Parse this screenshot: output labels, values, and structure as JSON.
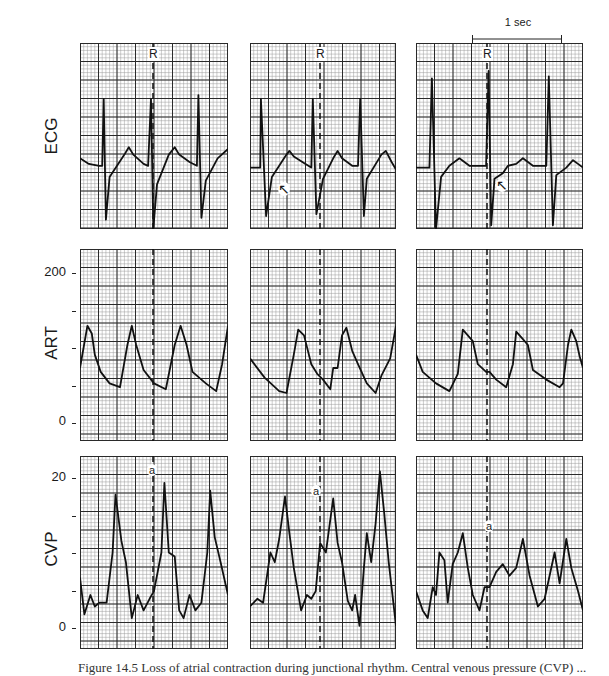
{
  "rows": [
    {
      "id": "ecg",
      "label": "ECG"
    },
    {
      "id": "art",
      "label": "ART",
      "ticks": [
        {
          "label": "200",
          "value": 200
        },
        {
          "label": "",
          "value": 150
        },
        {
          "label": "",
          "value": 100
        },
        {
          "label": "",
          "value": 50
        },
        {
          "label": "0",
          "value": 0
        }
      ]
    },
    {
      "id": "cvp",
      "label": "CVP",
      "ticks": [
        {
          "label": "20",
          "value": 20
        },
        {
          "label": "",
          "value": 15
        },
        {
          "label": "",
          "value": 10
        },
        {
          "label": "",
          "value": 5
        },
        {
          "label": "0",
          "value": 0
        }
      ]
    }
  ],
  "annotations": {
    "r_label": "R",
    "a_label": "a",
    "scale_bar": "1 sec",
    "caption": "Figure 14.5 Loss of atrial contraction during junctional rhythm. Central venous pressure (CVP) ..."
  },
  "colors": {
    "grid_minor": "#9a9a9a",
    "grid_major": "#2a2a2a",
    "trace": "#111111",
    "background": "#ffffff"
  },
  "chart_data": {
    "type": "line",
    "title": "",
    "layout": "3x3 grid of strip-chart panels (rows: ECG, ART, CVP; columns: three rhythm conditions)",
    "grid": true,
    "series": [
      {
        "row": "ECG",
        "column": 1,
        "description": "Regular sinus rhythm, R peaks at ~0.3, ~1.3, ~2.3 s"
      },
      {
        "row": "ECG",
        "column": 2,
        "description": "Rhythm with arrow marking retrograde P/notch after QRS"
      },
      {
        "row": "ECG",
        "column": 3,
        "description": "Tall narrow QRS complexes, arrow marking notch after QRS"
      },
      {
        "row": "ART",
        "column": 1,
        "ylabel": "ART",
        "ylim": [
          0,
          200
        ],
        "systolic_peaks": [
          120,
          120,
          120
        ],
        "diastolic_troughs": [
          58,
          55,
          55
        ]
      },
      {
        "row": "ART",
        "column": 2,
        "ylabel": "ART",
        "ylim": [
          0,
          200
        ],
        "systolic_peaks": [
          120,
          120,
          122
        ],
        "diastolic_troughs": [
          55,
          50,
          50
        ]
      },
      {
        "row": "ART",
        "column": 3,
        "ylabel": "ART",
        "ylim": [
          0,
          200
        ],
        "systolic_peaks": [
          125,
          120,
          122
        ],
        "diastolic_troughs": [
          58,
          53,
          55
        ]
      },
      {
        "row": "CVP",
        "column": 1,
        "ylabel": "CVP",
        "ylim": [
          0,
          20
        ],
        "a_wave_peak": 19,
        "peaks": [
          18,
          19,
          18
        ],
        "troughs": [
          2,
          2,
          3
        ]
      },
      {
        "row": "CVP",
        "column": 2,
        "ylabel": "CVP",
        "ylim": [
          0,
          20
        ],
        "a_wave_peak": 17,
        "peaks": [
          17,
          17,
          20.5
        ],
        "troughs": [
          3,
          3,
          0.5
        ]
      },
      {
        "row": "CVP",
        "column": 3,
        "ylabel": "CVP",
        "ylim": [
          0,
          20
        ],
        "a_wave_peak": 11.5,
        "peaks": [
          12,
          11.5,
          12
        ],
        "troughs": [
          1,
          2,
          3
        ]
      }
    ],
    "xlabel": "time (scale bar = 1 sec)",
    "x_scale": "1 sec",
    "vertical_markers": "dashed line at R wave in each column"
  }
}
